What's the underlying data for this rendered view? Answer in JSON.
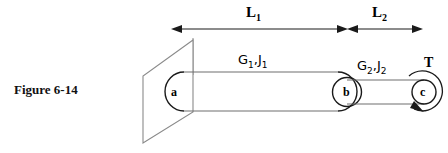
{
  "figure": {
    "caption": "Figure 6-14"
  },
  "dimensions": [
    {
      "id": "L1",
      "label": "L",
      "sub": "1",
      "x_start": 172,
      "x_end": 347
    },
    {
      "id": "L2",
      "label": "L",
      "sub": "2",
      "x_start": 347,
      "x_end": 422
    }
  ],
  "materials": [
    {
      "id": "seg1",
      "label": "G",
      "sub1": "1",
      "sep": ",",
      "label2": "J",
      "sub2": "1",
      "text": "G1,J1"
    },
    {
      "id": "seg2",
      "label": "G",
      "sub1": "2",
      "sep": ",",
      "label2": "J",
      "sub2": "2",
      "text": "G2,J2"
    }
  ],
  "nodes": [
    {
      "id": "a",
      "label": "a"
    },
    {
      "id": "b",
      "label": "b"
    },
    {
      "id": "c",
      "label": "c"
    }
  ],
  "torque": {
    "label": "T",
    "direction": "clockwise"
  },
  "colors": {
    "line": "#1a1a1a",
    "wall_line": "#8a8a8a",
    "shaft_line": "#6f6f6f",
    "text": "#000000",
    "background": "#ffffff"
  }
}
